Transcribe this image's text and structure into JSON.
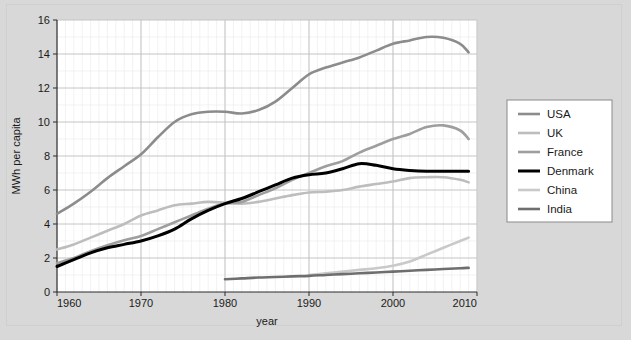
{
  "figure": {
    "background_color": "#d8d8d8",
    "plot_background_color": "#ffffff",
    "border_color": "#cfcfcf"
  },
  "legend": {
    "position": "right-middle",
    "border_color": "#8a8a8a",
    "background_color": "#ffffff",
    "entries": [
      {
        "label": "USA",
        "color": "#8c8c8c"
      },
      {
        "label": "UK",
        "color": "#bdbdbd"
      },
      {
        "label": "France",
        "color": "#9e9e9e"
      },
      {
        "label": "Denmark",
        "color": "#000000"
      },
      {
        "label": "China",
        "color": "#c9c9c9"
      },
      {
        "label": "India",
        "color": "#6e6e6e"
      }
    ]
  },
  "chart_data": {
    "type": "line",
    "title": "",
    "xlabel": "year",
    "ylabel": "MWh per capita",
    "xlim": [
      1960,
      2010
    ],
    "ylim": [
      0,
      16
    ],
    "xticks": [
      1960,
      1970,
      1980,
      1990,
      2000,
      2010
    ],
    "yticks": [
      0,
      2,
      4,
      6,
      8,
      10,
      12,
      14,
      16
    ],
    "grid": true,
    "grid_major_color": "#c4c4c4",
    "grid_minor_color": "#ececec",
    "legend_position": "right",
    "series": [
      {
        "name": "USA",
        "color": "#8c8c8c",
        "linewidth": 2.6,
        "x": [
          1960,
          1962,
          1964,
          1966,
          1968,
          1970,
          1972,
          1974,
          1976,
          1978,
          1980,
          1982,
          1984,
          1986,
          1988,
          1990,
          1992,
          1994,
          1996,
          1998,
          2000,
          2002,
          2004,
          2006,
          2008,
          2009
        ],
        "y": [
          4.6,
          5.2,
          5.9,
          6.7,
          7.4,
          8.1,
          9.1,
          10.0,
          10.45,
          10.6,
          10.6,
          10.5,
          10.7,
          11.2,
          12.0,
          12.8,
          13.2,
          13.5,
          13.8,
          14.2,
          14.6,
          14.8,
          15.0,
          14.95,
          14.6,
          14.1
        ]
      },
      {
        "name": "UK",
        "color": "#bdbdbd",
        "linewidth": 2.6,
        "x": [
          1960,
          1962,
          1964,
          1966,
          1968,
          1970,
          1972,
          1974,
          1976,
          1978,
          1980,
          1982,
          1984,
          1986,
          1988,
          1990,
          1992,
          1994,
          1996,
          1998,
          2000,
          2002,
          2004,
          2006,
          2008,
          2009
        ],
        "y": [
          2.5,
          2.8,
          3.2,
          3.6,
          4.0,
          4.5,
          4.8,
          5.1,
          5.2,
          5.3,
          5.25,
          5.2,
          5.3,
          5.5,
          5.7,
          5.85,
          5.9,
          6.0,
          6.2,
          6.35,
          6.5,
          6.7,
          6.75,
          6.75,
          6.6,
          6.45
        ]
      },
      {
        "name": "France",
        "color": "#9e9e9e",
        "linewidth": 2.6,
        "x": [
          1960,
          1962,
          1964,
          1966,
          1968,
          1970,
          1972,
          1974,
          1976,
          1978,
          1980,
          1982,
          1984,
          1986,
          1988,
          1990,
          1992,
          1994,
          1996,
          1998,
          2000,
          2002,
          2004,
          2006,
          2008,
          2009
        ],
        "y": [
          1.7,
          2.0,
          2.4,
          2.75,
          3.05,
          3.3,
          3.7,
          4.1,
          4.5,
          4.9,
          5.2,
          5.3,
          5.7,
          6.1,
          6.6,
          7.0,
          7.4,
          7.7,
          8.2,
          8.6,
          9.0,
          9.3,
          9.7,
          9.8,
          9.5,
          9.0
        ]
      },
      {
        "name": "Denmark",
        "color": "#000000",
        "linewidth": 3.0,
        "x": [
          1960,
          1962,
          1964,
          1966,
          1968,
          1970,
          1972,
          1974,
          1976,
          1978,
          1980,
          1982,
          1984,
          1986,
          1988,
          1990,
          1992,
          1994,
          1996,
          1998,
          2000,
          2002,
          2004,
          2006,
          2008,
          2009
        ],
        "y": [
          1.5,
          1.9,
          2.3,
          2.6,
          2.8,
          3.0,
          3.3,
          3.7,
          4.3,
          4.8,
          5.2,
          5.5,
          5.9,
          6.3,
          6.7,
          6.9,
          7.0,
          7.25,
          7.55,
          7.45,
          7.25,
          7.15,
          7.1,
          7.1,
          7.1,
          7.1
        ]
      },
      {
        "name": "China",
        "color": "#c9c9c9",
        "linewidth": 2.6,
        "x": [
          1990,
          1992,
          1994,
          1996,
          1998,
          2000,
          2002,
          2004,
          2006,
          2008,
          2009
        ],
        "y": [
          1.0,
          1.1,
          1.2,
          1.3,
          1.4,
          1.55,
          1.8,
          2.2,
          2.6,
          3.0,
          3.2
        ]
      },
      {
        "name": "India",
        "color": "#6e6e6e",
        "linewidth": 2.6,
        "x": [
          1980,
          1982,
          1984,
          1986,
          1988,
          1990,
          1992,
          1994,
          1996,
          1998,
          2000,
          2002,
          2004,
          2006,
          2008,
          2009
        ],
        "y": [
          0.75,
          0.8,
          0.85,
          0.88,
          0.92,
          0.95,
          1.0,
          1.05,
          1.1,
          1.15,
          1.2,
          1.25,
          1.3,
          1.35,
          1.4,
          1.42
        ]
      }
    ]
  }
}
